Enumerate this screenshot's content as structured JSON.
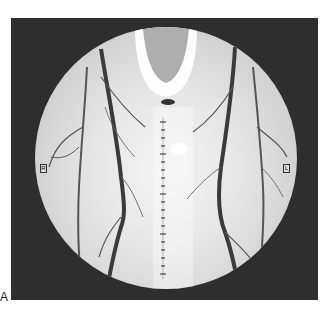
{
  "figure": {
    "panel_label": "A",
    "left_marker": "R",
    "right_marker": "L",
    "scale": {
      "orientation": "vertical",
      "tick_count": 20
    },
    "colors": {
      "frame": "#2e2e2e",
      "field_center": "#f4f4f4",
      "field_edge": "#b9b9b9",
      "vessel": "#3a3a3a",
      "background": "#ffffff"
    }
  }
}
